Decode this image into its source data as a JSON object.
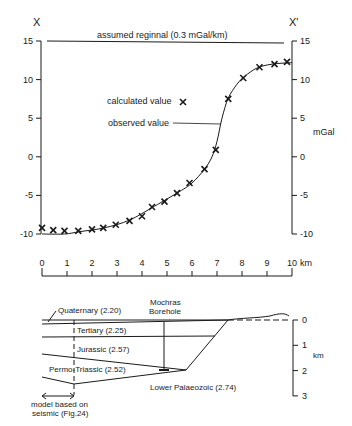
{
  "chart_data": {
    "type": "line",
    "title": "",
    "xlabel": "km",
    "ylabel": "mGal",
    "profile_start_label": "X",
    "profile_end_label": "X'",
    "xlim": [
      0,
      10
    ],
    "ylim": [
      -10,
      15
    ],
    "x_ticks": [
      "0",
      "1",
      "2",
      "3",
      "4",
      "5",
      "6",
      "7",
      "8",
      "9",
      "10"
    ],
    "y_ticks_left": [
      "15",
      "10",
      "5",
      "0",
      "-5",
      "-10"
    ],
    "y_ticks_right": [
      "15",
      "10",
      "5",
      "0",
      "-5",
      "-10"
    ],
    "grid": false,
    "annotations": {
      "regional": "assumed reginnal (0.3 mGal/km)",
      "calculated_legend": "calculated value",
      "observed_legend": "observed value"
    },
    "series": [
      {
        "name": "calculated value",
        "marker": "x",
        "x": [
          0.0,
          0.45,
          0.9,
          1.45,
          2.0,
          2.45,
          2.95,
          3.5,
          4.0,
          4.4,
          4.9,
          5.4,
          5.9,
          6.5,
          6.95,
          7.45,
          8.05,
          8.7,
          9.3,
          9.8
        ],
        "y": [
          -9.2,
          -9.5,
          -9.6,
          -9.6,
          -9.4,
          -9.2,
          -8.8,
          -8.3,
          -7.7,
          -6.5,
          -5.8,
          -4.7,
          -3.4,
          -1.6,
          0.9,
          7.5,
          10.2,
          11.6,
          12.0,
          12.3
        ]
      },
      {
        "name": "observed value",
        "style": "line",
        "x": [
          0.0,
          0.9,
          1.5,
          2.5,
          3.5,
          4.5,
          5.5,
          6.0,
          6.5,
          6.8,
          7.0,
          7.2,
          7.45,
          7.8,
          8.1,
          8.6,
          9.2,
          10.0
        ],
        "y": [
          -10.0,
          -10.0,
          -9.7,
          -9.2,
          -8.2,
          -6.4,
          -4.5,
          -3.4,
          -1.6,
          0.0,
          2.0,
          5.0,
          7.6,
          9.4,
          10.4,
          11.5,
          12.0,
          12.2
        ]
      }
    ],
    "regional_line": {
      "x": [
        0,
        10
      ],
      "y": [
        15,
        14.7
      ]
    }
  },
  "scale_bar": {
    "ticks": [
      "0",
      "1",
      "2",
      "3",
      "4",
      "5",
      "6",
      "7",
      "8",
      "9",
      "10"
    ],
    "unit": "km"
  },
  "cross_section": {
    "borehole_label_1": "Mochras",
    "borehole_label_2": "Borehole",
    "layers": [
      {
        "name": "Quaternary (2.20)"
      },
      {
        "name": "Tertiary (2.25)"
      },
      {
        "name": "Jurassic (2.57)"
      },
      {
        "name": "Permo-Triassic (2.52)"
      },
      {
        "name": "Lower Palaeozoic (2.74)"
      }
    ],
    "model_note_1": "model based on",
    "model_note_2": "seismic (Fig.24)",
    "depth_ticks": [
      "0",
      "1",
      "2",
      "3"
    ],
    "depth_unit": "km"
  }
}
